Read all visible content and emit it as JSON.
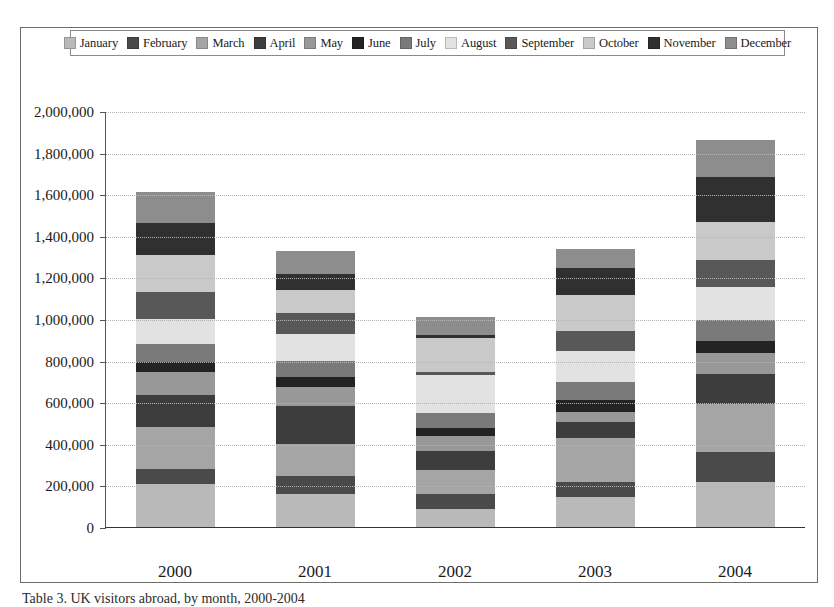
{
  "figure": {
    "caption": "Table 3. UK visitors abroad, by month, 2000-2004"
  },
  "legend": {
    "position": "top-center",
    "items": [
      {
        "label": "January",
        "color": "#b9b9b9"
      },
      {
        "label": "February",
        "color": "#4a4a4a"
      },
      {
        "label": "March",
        "color": "#a5a5a5"
      },
      {
        "label": "April",
        "color": "#3d3d3d"
      },
      {
        "label": "May",
        "color": "#989898"
      },
      {
        "label": "June",
        "color": "#232323"
      },
      {
        "label": "July",
        "color": "#7a7a7a"
      },
      {
        "label": "August",
        "color": "#e2e2e2"
      },
      {
        "label": "September",
        "color": "#585858"
      },
      {
        "label": "October",
        "color": "#c9c9c9"
      },
      {
        "label": "November",
        "color": "#303030"
      },
      {
        "label": "December",
        "color": "#8d8d8d"
      }
    ]
  },
  "chart_data": {
    "type": "bar",
    "stacked": true,
    "title": "",
    "xlabel": "",
    "ylabel": "",
    "categories": [
      "2000",
      "2001",
      "2002",
      "2003",
      "2004"
    ],
    "ylim": [
      0,
      2000000
    ],
    "ytick_values": [
      0,
      200000,
      400000,
      600000,
      800000,
      1000000,
      1200000,
      1400000,
      1600000,
      1800000,
      2000000
    ],
    "ytick_labels": [
      "0",
      "200,000",
      "400,000",
      "600,000",
      "800,000",
      "1,000,000",
      "1,200,000",
      "1,400,000",
      "1,600,000",
      "1,800,000",
      "2,000,000"
    ],
    "grid": true,
    "series": [
      {
        "name": "January",
        "color": "#b9b9b9",
        "values": [
          205000,
          160000,
          85000,
          145000,
          215000
        ]
      },
      {
        "name": "February",
        "color": "#4a4a4a",
        "values": [
          75000,
          85000,
          75000,
          70000,
          145000
        ]
      },
      {
        "name": "March",
        "color": "#a5a5a5",
        "values": [
          200000,
          155000,
          115000,
          215000,
          230000
        ]
      },
      {
        "name": "April",
        "color": "#3d3d3d",
        "values": [
          155000,
          180000,
          90000,
          75000,
          145000
        ]
      },
      {
        "name": "May",
        "color": "#989898",
        "values": [
          110000,
          95000,
          75000,
          50000,
          100000
        ]
      },
      {
        "name": "June",
        "color": "#232323",
        "values": [
          50000,
          45000,
          35000,
          55000,
          60000
        ]
      },
      {
        "name": "July",
        "color": "#7a7a7a",
        "values": [
          85000,
          80000,
          75000,
          85000,
          100000
        ]
      },
      {
        "name": "August",
        "color": "#e2e2e2",
        "values": [
          120000,
          130000,
          180000,
          150000,
          160000
        ]
      },
      {
        "name": "September",
        "color": "#585858",
        "values": [
          130000,
          100000,
          15000,
          100000,
          130000
        ]
      },
      {
        "name": "October",
        "color": "#c9c9c9",
        "values": [
          180000,
          110000,
          165000,
          170000,
          180000
        ]
      },
      {
        "name": "November",
        "color": "#303030",
        "values": [
          150000,
          75000,
          15000,
          130000,
          220000
        ]
      },
      {
        "name": "December",
        "color": "#8d8d8d",
        "values": [
          150000,
          110000,
          85000,
          90000,
          175000
        ]
      }
    ],
    "totals": [
      1610000,
      1325000,
      1010000,
      1335000,
      1860000
    ]
  }
}
